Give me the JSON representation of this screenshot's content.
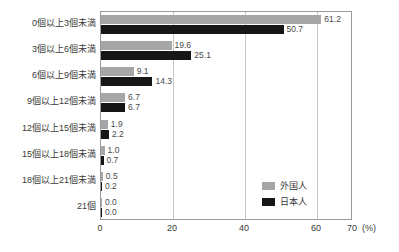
{
  "chart_data": {
    "type": "bar",
    "orientation": "horizontal",
    "title": "",
    "subtitle": "",
    "xlabel": "(%)",
    "ylabel": "",
    "xlim": [
      0,
      70
    ],
    "xticks": [
      0,
      20,
      40,
      60,
      70
    ],
    "xtick_labels": [
      "0",
      "20",
      "40",
      "60",
      "70"
    ],
    "grid": true,
    "grid_axis": "x",
    "legend_position": "inside-bottom-right",
    "categories": [
      "0個以上3個未満",
      "3個以上6個未満",
      "6個以上9個未満",
      "9個以上12個未満",
      "12個以上15個未満",
      "15個以上18個未満",
      "18個以上21個未満",
      "21個"
    ],
    "series": [
      {
        "name": "外国人",
        "color": "#a6a6a6",
        "values": [
          61.2,
          19.6,
          9.1,
          6.7,
          1.9,
          1.0,
          0.5,
          0.0
        ],
        "labels": [
          "61.2",
          "19.6",
          "9.1",
          "6.7",
          "1.9",
          "1.0",
          "0.5",
          "0.0"
        ]
      },
      {
        "name": "日本人",
        "color": "#161616",
        "values": [
          50.7,
          25.1,
          14.3,
          6.7,
          2.2,
          0.7,
          0.2,
          0.0
        ],
        "labels": [
          "50.7",
          "25.1",
          "14.3",
          "6.7",
          "2.2",
          "0.7",
          "0.2",
          "0.0"
        ]
      }
    ]
  },
  "axis": {
    "unit_label": "(%)"
  },
  "legend": {
    "items": [
      {
        "label": "外国人",
        "color": "#a6a6a6"
      },
      {
        "label": "日本人",
        "color": "#161616"
      }
    ]
  },
  "colors": {
    "series_foreign": "#a6a6a6",
    "series_japanese": "#161616",
    "frame": "#9a9a9a",
    "gridline": "#c8c8c8",
    "text": "#3a3a3a"
  }
}
